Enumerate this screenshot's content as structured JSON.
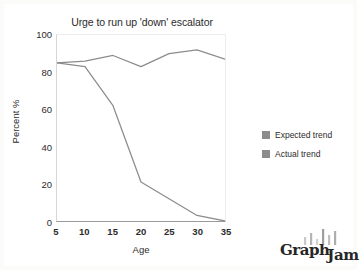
{
  "chart_data": {
    "type": "line",
    "title": "Urge to run up 'down' escalator",
    "xlabel": "Age",
    "ylabel": "Percent %",
    "x": [
      5,
      10,
      15,
      20,
      25,
      30,
      35
    ],
    "xlim": [
      5,
      35
    ],
    "ylim": [
      0,
      100
    ],
    "xticks": [
      "5",
      "10",
      "15",
      "20",
      "25",
      "30",
      "35"
    ],
    "yticks": [
      "0",
      "20",
      "40",
      "60",
      "80",
      "100"
    ],
    "grid": false,
    "legend_position": "right",
    "series": [
      {
        "name": "Expected trend",
        "color": "#8c8c8c",
        "values": [
          85,
          86,
          89,
          83,
          90,
          92,
          87
        ]
      },
      {
        "name": "Actual trend",
        "color": "#8c8c8c",
        "values": [
          85,
          83,
          62,
          21,
          12,
          3,
          0
        ]
      }
    ]
  },
  "legend": {
    "items": [
      {
        "label": "Expected trend",
        "color": "#8c8c8c"
      },
      {
        "label": "Actual trend",
        "color": "#8c8c8c"
      }
    ]
  },
  "watermark": {
    "text_primary": "Graph",
    "text_secondary": "Jam"
  }
}
